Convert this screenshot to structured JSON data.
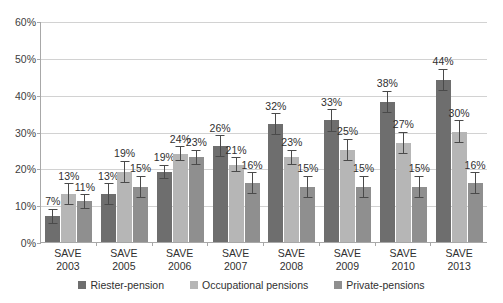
{
  "chart_data": {
    "type": "bar",
    "title": "",
    "subtitle": "",
    "xlabel": "",
    "ylabel": "",
    "ylim": [
      0,
      60
    ],
    "yticks": [
      "0%",
      "10%",
      "20%",
      "30%",
      "40%",
      "50%",
      "60%"
    ],
    "ytick_values": [
      0,
      10,
      20,
      30,
      40,
      50,
      60
    ],
    "grid": true,
    "legend_position": "bottom",
    "categories": [
      "SAVE 2003",
      "SAVE 2005",
      "SAVE 2006",
      "SAVE 2007",
      "SAVE 2008",
      "SAVE 2009",
      "SAVE 2010",
      "SAVE 2013"
    ],
    "category_lines": [
      [
        "SAVE",
        "2003"
      ],
      [
        "SAVE",
        "2005"
      ],
      [
        "SAVE",
        "2006"
      ],
      [
        "SAVE",
        "2007"
      ],
      [
        "SAVE",
        "2008"
      ],
      [
        "SAVE",
        "2009"
      ],
      [
        "SAVE",
        "2010"
      ],
      [
        "SAVE",
        "2013"
      ]
    ],
    "series": [
      {
        "name": "Riester-pension",
        "color": "#6e6e6e",
        "values": [
          7,
          13,
          19,
          26,
          32,
          33,
          38,
          44
        ],
        "labels": [
          "7%",
          "13%",
          "19%",
          "26%",
          "32%",
          "33%",
          "38%",
          "44%"
        ],
        "err_low": [
          2,
          3,
          2,
          3,
          3,
          3,
          3,
          3
        ],
        "err_high": [
          2,
          3,
          2,
          3,
          3,
          3,
          3,
          3
        ]
      },
      {
        "name": "Occupational pensions",
        "color": "#b6b6b6",
        "values": [
          13,
          19,
          24,
          21,
          23,
          25,
          27,
          30
        ],
        "labels": [
          "13%",
          "19%",
          "24%",
          "21%",
          "23%",
          "25%",
          "27%",
          "30%"
        ],
        "err_low": [
          3,
          3,
          2,
          2,
          2,
          3,
          3,
          3
        ],
        "err_high": [
          3,
          3,
          2,
          2,
          2,
          3,
          3,
          3
        ]
      },
      {
        "name": "Private-pensions",
        "color": "#8f8f8f",
        "values": [
          11,
          15,
          23,
          16,
          15,
          15,
          15,
          16
        ],
        "labels": [
          "11%",
          "15%",
          "23%",
          "16%",
          "15%",
          "15%",
          "15%",
          "16%"
        ],
        "err_low": [
          2,
          3,
          2,
          3,
          3,
          3,
          3,
          3
        ],
        "err_high": [
          2,
          3,
          2,
          3,
          3,
          3,
          3,
          3
        ]
      }
    ],
    "legend": [
      {
        "label": "Riester-pension",
        "color": "#6e6e6e"
      },
      {
        "label": "Occupational pensions",
        "color": "#b6b6b6"
      },
      {
        "label": "Private-pensions",
        "color": "#8f8f8f"
      }
    ]
  }
}
